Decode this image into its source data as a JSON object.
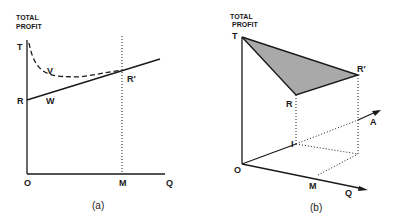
{
  "colors": {
    "ink": "#1a1a1a",
    "shade": "#a9a9a9",
    "background": "#ffffff"
  },
  "panel_a": {
    "caption": "(a)",
    "axis_title_line1": "TOTAL",
    "axis_title_line2": "PROFIT",
    "labels": {
      "T": "T",
      "R": "R",
      "R_prime": "R′",
      "V": "V",
      "W": "W",
      "O": "O",
      "M": "M",
      "Q": "Q"
    },
    "curves": [
      {
        "name": "V",
        "style": "dashed",
        "description": "declining then flattening curve from T to R′"
      },
      {
        "name": "W",
        "style": "solid",
        "description": "rising straight line from R through R′"
      }
    ],
    "vertical_marker": {
      "at": "M",
      "style": "dotted"
    }
  },
  "panel_b": {
    "caption": "(b)",
    "axis_title_line1": "TOTAL",
    "axis_title_line2": "PROFIT",
    "labels": {
      "T": "T",
      "R": "R",
      "R_prime": "R′",
      "I": "I",
      "A": "A",
      "O": "O",
      "M": "M",
      "Q": "Q"
    },
    "shaded_region": [
      "T",
      "R",
      "R′"
    ],
    "axes": [
      "Total Profit (vertical)",
      "Q",
      "A"
    ]
  }
}
